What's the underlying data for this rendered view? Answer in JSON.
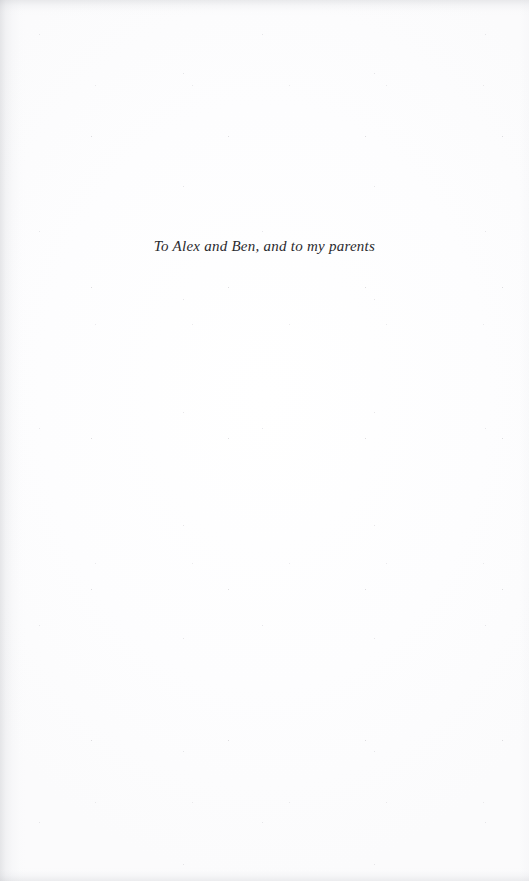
{
  "page": {
    "type": "book-dedication-page",
    "width": 529,
    "height": 881,
    "paper_color": "#fdfdfd",
    "ink_color": "#2a2a2e"
  },
  "dedication": {
    "text": "To Alex and Ben, and to my parents"
  }
}
